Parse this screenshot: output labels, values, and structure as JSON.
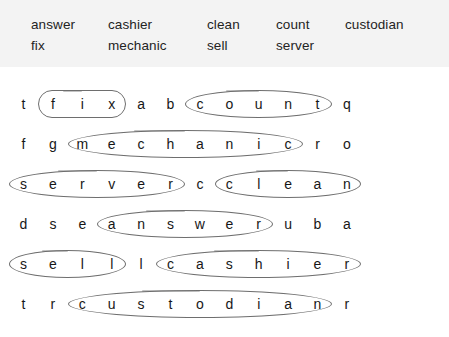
{
  "puzzle": {
    "title": "word-search",
    "word_bank": {
      "rows": [
        [
          "answer",
          "cashier",
          "clean",
          "count",
          "custodian"
        ],
        [
          "fix",
          "mechanic",
          "sell",
          "server"
        ]
      ]
    },
    "grid": {
      "columns": 12,
      "rows": [
        [
          "t",
          "f",
          "i",
          "x",
          "a",
          "b",
          "c",
          "o",
          "u",
          "n",
          "t",
          "q"
        ],
        [
          "f",
          "g",
          "m",
          "e",
          "c",
          "h",
          "a",
          "n",
          "i",
          "c",
          "r",
          "o"
        ],
        [
          "s",
          "e",
          "r",
          "v",
          "e",
          "r",
          "c",
          "c",
          "l",
          "e",
          "a",
          "n"
        ],
        [
          "d",
          "s",
          "e",
          "a",
          "n",
          "s",
          "w",
          "e",
          "r",
          "u",
          "b",
          "a"
        ],
        [
          "s",
          "e",
          "l",
          "l",
          "l",
          "c",
          "a",
          "s",
          "h",
          "i",
          "e",
          "r"
        ],
        [
          "t",
          "r",
          "c",
          "u",
          "s",
          "t",
          "o",
          "d",
          "i",
          "a",
          "n",
          "r"
        ]
      ]
    },
    "found_words": [
      {
        "word": "fix",
        "row": 0,
        "start_col": 1,
        "end_col": 3,
        "shape": "capsule"
      },
      {
        "word": "count",
        "row": 0,
        "start_col": 6,
        "end_col": 10,
        "shape": "ellipse"
      },
      {
        "word": "mechanic",
        "row": 1,
        "start_col": 2,
        "end_col": 9,
        "shape": "ellipse"
      },
      {
        "word": "server",
        "row": 2,
        "start_col": 0,
        "end_col": 5,
        "shape": "ellipse"
      },
      {
        "word": "clean",
        "row": 2,
        "start_col": 7,
        "end_col": 11,
        "shape": "ellipse"
      },
      {
        "word": "answer",
        "row": 3,
        "start_col": 3,
        "end_col": 8,
        "shape": "ellipse"
      },
      {
        "word": "sell",
        "row": 4,
        "start_col": 0,
        "end_col": 3,
        "shape": "ellipse"
      },
      {
        "word": "cashier",
        "row": 4,
        "start_col": 5,
        "end_col": 11,
        "shape": "ellipse"
      },
      {
        "word": "custodian",
        "row": 5,
        "start_col": 2,
        "end_col": 10,
        "shape": "ellipse"
      }
    ],
    "colors": {
      "page_background": "#ffffff",
      "wordbank_background": "#f3f3f3",
      "letter": "#171717",
      "ring_stroke": "#6e6e6e"
    }
  }
}
